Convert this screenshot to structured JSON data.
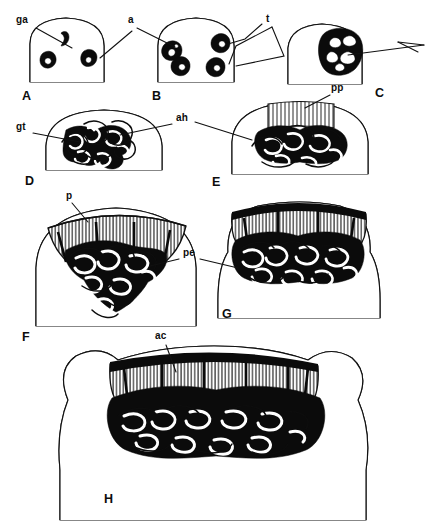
{
  "figure": {
    "type": "scientific-line-drawing-plate",
    "background_color": "#ffffff",
    "ink_color": "#111111",
    "panel_count": 8
  },
  "panels": [
    {
      "id": "A",
      "letter": "A",
      "x": 22,
      "y": 97,
      "stage": 1
    },
    {
      "id": "B",
      "letter": "B",
      "x": 152,
      "y": 97,
      "stage": 2
    },
    {
      "id": "C",
      "letter": "C",
      "x": 375,
      "y": 94,
      "stage": 3
    },
    {
      "id": "D",
      "letter": "D",
      "x": 25,
      "y": 182,
      "stage": 4
    },
    {
      "id": "E",
      "letter": "E",
      "x": 212,
      "y": 183,
      "stage": 5
    },
    {
      "id": "F",
      "letter": "F",
      "x": 22,
      "y": 338,
      "stage": 6
    },
    {
      "id": "G",
      "letter": "G",
      "x": 222,
      "y": 315,
      "stage": 7
    },
    {
      "id": "H",
      "letter": "H",
      "x": 104,
      "y": 500,
      "stage": 8
    }
  ],
  "annotations": [
    {
      "id": "ga",
      "text": "ga",
      "x": 16,
      "y": 20,
      "panel": "A",
      "meaning": "gland-anlage-label"
    },
    {
      "id": "a",
      "text": "a",
      "x": 128,
      "y": 20,
      "panel": "A",
      "meaning": "cell-a-label"
    },
    {
      "id": "t",
      "text": "t",
      "x": 266,
      "y": 19,
      "panel": "B",
      "meaning": "cell-t-label"
    },
    {
      "id": "gt",
      "text": "gt",
      "x": 16,
      "y": 127,
      "panel": "D",
      "meaning": "gland-tissue-label"
    },
    {
      "id": "ah",
      "text": "ah",
      "x": 176,
      "y": 118,
      "panel": "D",
      "meaning": "ah-structure-label"
    },
    {
      "id": "pp",
      "text": "pp",
      "x": 331,
      "y": 88,
      "panel": "E",
      "meaning": "pp-palisade-primordium-label"
    },
    {
      "id": "p",
      "text": "p",
      "x": 66,
      "y": 196,
      "panel": "F",
      "meaning": "palisade-label"
    },
    {
      "id": "pe",
      "text": "pe",
      "x": 183,
      "y": 253,
      "panel": "F",
      "meaning": "pe-epithelium-label"
    },
    {
      "id": "ac",
      "text": "ac",
      "x": 155,
      "y": 336,
      "panel": "H",
      "meaning": "ac-apical-cap-label"
    }
  ],
  "leader_lines": [
    {
      "id": "ga-leader",
      "from": [
        36,
        28
      ],
      "to": [
        72,
        48
      ],
      "annotation": "ga"
    },
    {
      "id": "a-leader",
      "from": [
        132,
        31
      ],
      "to": [
        100,
        58
      ],
      "annotation": "a"
    },
    {
      "id": "a-leader2",
      "from": [
        137,
        28
      ],
      "to": [
        175,
        47
      ],
      "annotation": "a"
    },
    {
      "id": "t-leader",
      "from": [
        262,
        24
      ],
      "to": [
        228,
        44
      ],
      "annotation": "t"
    },
    {
      "id": "t-leader2",
      "from": [
        268,
        26
      ],
      "to": [
        245,
        48
      ],
      "annotation": "t"
    },
    {
      "id": "c-leader",
      "from": [
        424,
        45
      ],
      "to": [
        348,
        55
      ],
      "annotation": "C-arrow"
    },
    {
      "id": "gt-leader",
      "from": [
        33,
        133
      ],
      "to": [
        80,
        142
      ],
      "annotation": "gt"
    },
    {
      "id": "ah-leader",
      "from": [
        172,
        124
      ],
      "to": [
        120,
        135
      ],
      "annotation": "ah"
    },
    {
      "id": "ah-leader2",
      "from": [
        195,
        122
      ],
      "to": [
        252,
        140
      ],
      "annotation": "ah"
    },
    {
      "id": "pp-leader",
      "from": [
        330,
        95
      ],
      "to": [
        305,
        108
      ],
      "annotation": "pp"
    },
    {
      "id": "p-leader",
      "from": [
        72,
        203
      ],
      "to": [
        88,
        222
      ],
      "annotation": "p"
    },
    {
      "id": "pe-leader",
      "from": [
        179,
        259
      ],
      "to": [
        150,
        266
      ],
      "annotation": "pe"
    },
    {
      "id": "pe-leader2",
      "from": [
        200,
        259
      ],
      "to": [
        238,
        268
      ],
      "annotation": "pe"
    },
    {
      "id": "ac-leader",
      "from": [
        166,
        345
      ],
      "to": [
        176,
        372
      ],
      "annotation": "ac"
    }
  ]
}
